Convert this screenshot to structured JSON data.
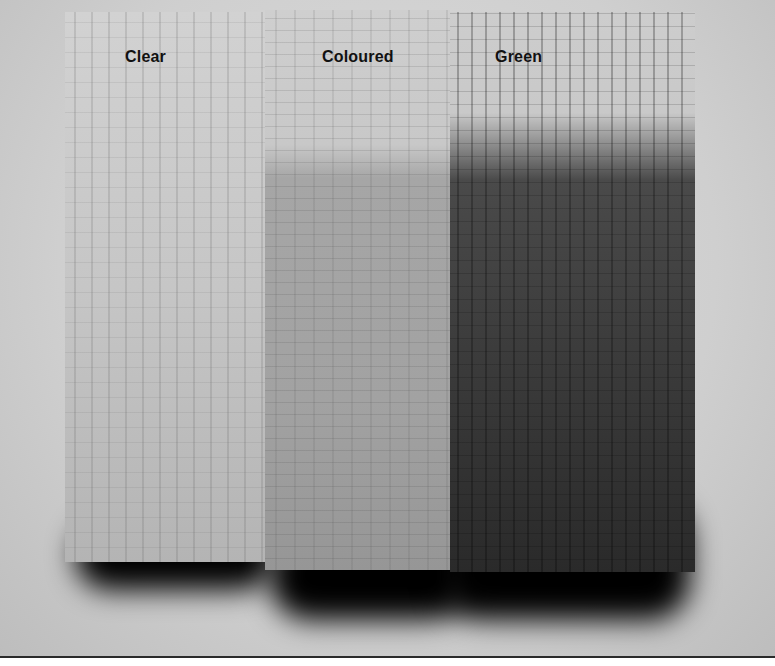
{
  "image": {
    "description": "Grayscale photograph of three sawn timber boards treated with different wood preservatives",
    "boards": [
      {
        "label": "Clear",
        "tone": "#c8c8c8"
      },
      {
        "label": "Coloured",
        "tone": "#a9a9a9"
      },
      {
        "label": "Green",
        "tone": "#3a3a3a"
      }
    ]
  }
}
